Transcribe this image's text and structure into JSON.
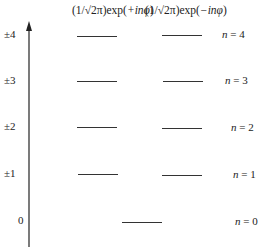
{
  "diagram": {
    "headers": [
      {
        "prefix": "(1/√2π)exp(",
        "sign": "+",
        "var": "inφ",
        "suffix": ")"
      },
      {
        "prefix": "(1/√2π)exp(",
        "sign": "−",
        "var": "inφ",
        "suffix": ")"
      }
    ],
    "axis": {
      "direction": "up",
      "arrow": true
    },
    "levels": [
      {
        "m_label": "±4",
        "n_label_var": "n",
        "n_label_rest": " = 4",
        "degenerate": true
      },
      {
        "m_label": "±3",
        "n_label_var": "n",
        "n_label_rest": " = 3",
        "degenerate": true
      },
      {
        "m_label": "±2",
        "n_label_var": "n",
        "n_label_rest": " = 2",
        "degenerate": true
      },
      {
        "m_label": "±1",
        "n_label_var": "n",
        "n_label_rest": " = 1",
        "degenerate": true
      },
      {
        "m_label": "0",
        "n_label_var": "n",
        "n_label_rest": " = 0",
        "degenerate": false
      }
    ]
  }
}
